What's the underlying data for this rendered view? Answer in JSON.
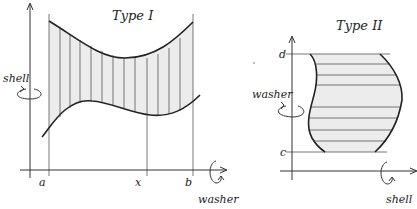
{
  "type1": {
    "title": "Type I",
    "rotation_labels": {
      "y_axis": "shell",
      "x_axis": "washer"
    },
    "tick_labels": {
      "a": "a",
      "x": "x",
      "b": "b"
    },
    "strip_orientation": "vertical"
  },
  "type2": {
    "title": "Type II",
    "rotation_labels": {
      "y_axis": "washer",
      "x_axis": "shell"
    },
    "tick_labels": {
      "c": "c",
      "d": "d"
    },
    "strip_orientation": "horizontal"
  },
  "colors": {
    "region_fill": "#ececec",
    "line": "#222222"
  }
}
